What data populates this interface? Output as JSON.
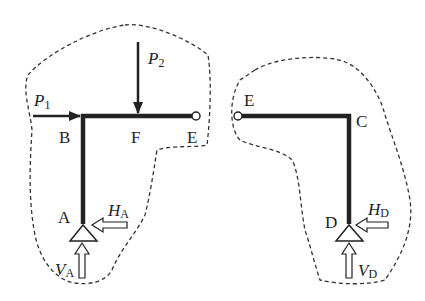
{
  "diagram": {
    "type": "free-body diagram of three-hinged frame (split at hinge E)",
    "colors": {
      "member": "#222222",
      "outline": "#333333",
      "background": "#ffffff"
    },
    "left_part": {
      "nodes": {
        "A": "A",
        "B": "B",
        "F": "F",
        "E": "E"
      },
      "loads": {
        "P1": {
          "symbol": "P",
          "subscript": "1",
          "direction": "right"
        },
        "P2": {
          "symbol": "P",
          "subscript": "2",
          "direction": "down"
        }
      },
      "reactions": {
        "HA": {
          "symbol": "H",
          "subscript": "A",
          "direction": "left"
        },
        "VA": {
          "symbol": "V",
          "subscript": "A",
          "direction": "up"
        }
      }
    },
    "right_part": {
      "nodes": {
        "E": "E",
        "C": "C",
        "D": "D"
      },
      "reactions": {
        "HD": {
          "symbol": "H",
          "subscript": "D",
          "direction": "left"
        },
        "VD": {
          "symbol": "V",
          "subscript": "D",
          "direction": "up"
        }
      }
    }
  }
}
